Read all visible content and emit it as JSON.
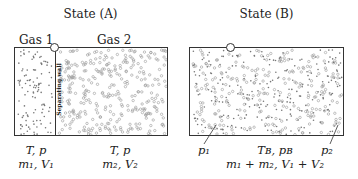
{
  "state_a": {
    "title": "State (A)",
    "gas1_label": "Gas 1",
    "gas2_label": "Gas 2",
    "wall_label": "Separating wall",
    "gas1_props": {
      "line1": "T, p",
      "line2": "m₁, V₁"
    },
    "gas2_props": {
      "line1": "T, p",
      "line2": "m₂, V₂"
    }
  },
  "state_b": {
    "title": "State (B)",
    "p1_label": "p₁",
    "p2_label": "p₂",
    "props": {
      "line1": "Tʙ, pʙ",
      "line2": "m₁ + m₂, V₁ + V₂"
    }
  },
  "colors": {
    "stroke": "#333333",
    "particle": "#777777"
  }
}
